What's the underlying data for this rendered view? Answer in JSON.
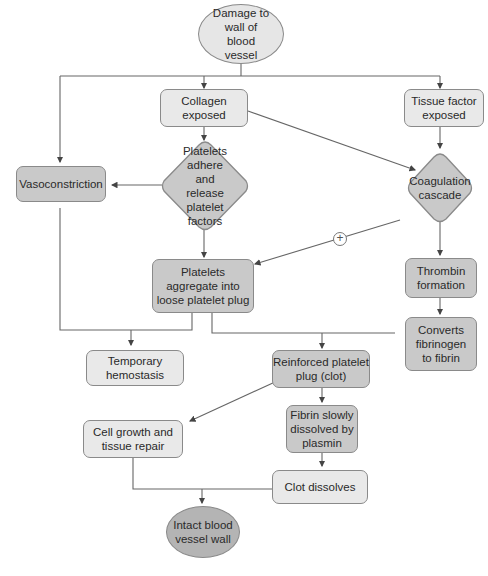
{
  "diagram": {
    "nodes": {
      "damage": "Damage to wall of blood vessel",
      "collagen": "Collagen exposed",
      "tissue_factor": "Tissue factor exposed",
      "vasoconstriction": "Vasoconstriction",
      "platelets_adhere": "Platelets adhere and release platelet factors",
      "coagulation": "Coagulation cascade",
      "aggregate": "Platelets aggregate into loose platelet plug",
      "thrombin": "Thrombin formation",
      "converts": "Converts fibrinogen to fibrin",
      "temporary": "Temporary hemostasis",
      "reinforced": "Reinforced platelet plug (clot)",
      "fibrin_dissolved": "Fibrin slowly dissolved by plasmin",
      "cell_growth": "Cell growth and tissue repair",
      "clot_dissolves": "Clot dissolves",
      "intact": "Intact blood vessel wall"
    },
    "positive_feedback_symbol": "+",
    "colors": {
      "light_fill": "#e9e9e9",
      "dark_fill": "#c9c9c9",
      "ellipse_fill": "#e6e6e6",
      "intact_fill": "#b4b4b4",
      "stroke": "#8a8a8a",
      "line": "#555555"
    }
  }
}
